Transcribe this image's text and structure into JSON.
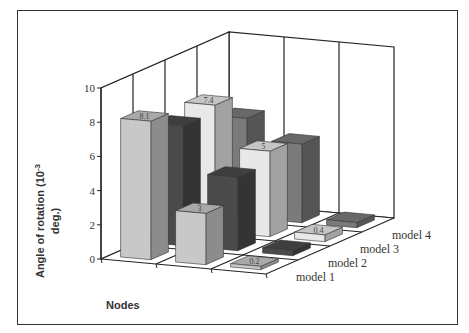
{
  "chart_data": {
    "type": "bar",
    "subtype": "3d-column",
    "title": "",
    "xlabel": "Nodes",
    "ylabel": "Angle of rotation (10⁻³ deg.)",
    "ylabel_line1": "Angle of rotation (10",
    "ylabel_sup": "-3",
    "ylabel_line2": "deg.)",
    "ylim": [
      0,
      10
    ],
    "yticks": [
      "0",
      "2",
      "4",
      "6",
      "8",
      "10"
    ],
    "categories": [
      "Node 1",
      "Node 2",
      "Node 3"
    ],
    "grid": true,
    "legend": "depth-axis-right",
    "series": [
      {
        "name": "model 1",
        "values": [
          8.1,
          3.0,
          0.2
        ],
        "labels": [
          "8.1",
          "3",
          "0.2"
        ],
        "color": "#c8c8c8"
      },
      {
        "name": "model 2",
        "values": [
          7.0,
          4.3,
          0.3
        ],
        "labels": [
          "",
          "",
          ""
        ],
        "color": "#4a4a4a"
      },
      {
        "name": "model 3",
        "values": [
          7.4,
          5.0,
          0.4
        ],
        "labels": [
          "7.4",
          "5",
          "0.4"
        ],
        "color": "#e8e8e8"
      },
      {
        "name": "model 4",
        "values": [
          5.8,
          4.6,
          0.3
        ],
        "labels": [
          "",
          "",
          ""
        ],
        "color": "#7a7a7a"
      }
    ]
  }
}
